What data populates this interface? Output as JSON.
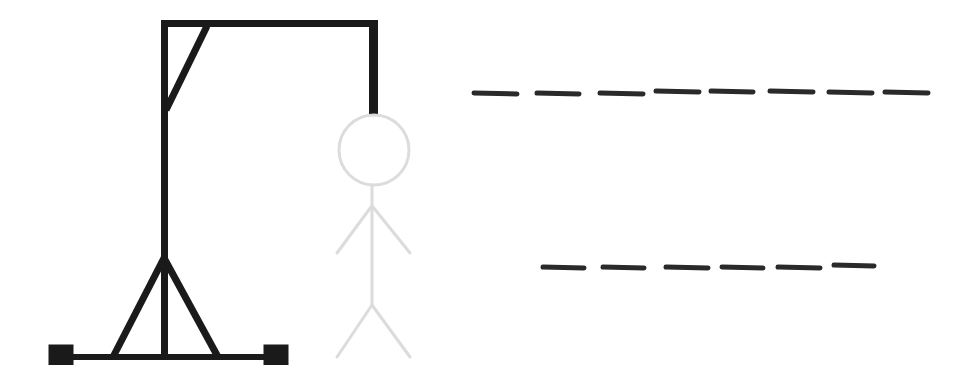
{
  "game": {
    "title": "Hangman",
    "colors": {
      "gallows": "#1a1a1a",
      "figure": "#dcdcdc",
      "dash": "#2a2a2a",
      "background": "#ffffff"
    },
    "gallows": {
      "parts": [
        "base",
        "left-foot",
        "right-foot",
        "pole",
        "left-strut",
        "right-strut",
        "top-beam",
        "corner-brace",
        "rope"
      ]
    },
    "figure": {
      "parts": [
        "head",
        "body",
        "left-arm",
        "right-arm",
        "left-leg",
        "right-leg"
      ],
      "state": "faded"
    },
    "words": [
      {
        "label": "Word 1 blanks",
        "letter_count": 8,
        "dashes": [
          {
            "x1": 474,
            "x2": 517,
            "y": 93
          },
          {
            "x1": 537,
            "x2": 579,
            "y": 93
          },
          {
            "x1": 600,
            "x2": 643,
            "y": 93
          },
          {
            "x1": 656,
            "x2": 699,
            "y": 91
          },
          {
            "x1": 711,
            "x2": 753,
            "y": 91
          },
          {
            "x1": 770,
            "x2": 813,
            "y": 91
          },
          {
            "x1": 829,
            "x2": 872,
            "y": 92
          },
          {
            "x1": 885,
            "x2": 928,
            "y": 92
          }
        ]
      },
      {
        "label": "Word 2 blanks",
        "letter_count": 6,
        "dashes": [
          {
            "x1": 543,
            "x2": 584,
            "y": 267
          },
          {
            "x1": 603,
            "x2": 644,
            "y": 267
          },
          {
            "x1": 666,
            "x2": 708,
            "y": 267
          },
          {
            "x1": 722,
            "x2": 763,
            "y": 267
          },
          {
            "x1": 778,
            "x2": 820,
            "y": 267
          },
          {
            "x1": 834,
            "x2": 874,
            "y": 265
          }
        ]
      }
    ]
  }
}
